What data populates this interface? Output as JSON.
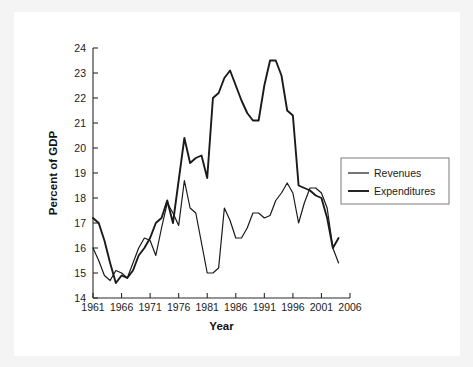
{
  "figure": {
    "background_color": "#f4f4f4",
    "card_color": "#ffffff",
    "line_color": "#1a1a1a"
  },
  "chart_data": {
    "type": "line",
    "title": "",
    "xlabel": "Year",
    "ylabel": "Percent of GDP",
    "xlim": [
      1961,
      2006
    ],
    "ylim": [
      14,
      24
    ],
    "xticks": [
      1961,
      1966,
      1971,
      1976,
      1981,
      1986,
      1991,
      1996,
      2001,
      2006
    ],
    "yticks": [
      14,
      15,
      16,
      17,
      18,
      19,
      20,
      21,
      22,
      23,
      24
    ],
    "xtick_labels": [
      "1961",
      "1966",
      "1971",
      "1976",
      "1981",
      "1986",
      "1991",
      "1996",
      "2001",
      "2006"
    ],
    "ytick_labels": [
      "14",
      "15",
      "16",
      "17",
      "18",
      "19",
      "20",
      "21",
      "22",
      "23",
      "24"
    ],
    "grid": false,
    "legend_position": "right",
    "x": [
      1961,
      1962,
      1963,
      1964,
      1965,
      1966,
      1967,
      1968,
      1969,
      1970,
      1971,
      1972,
      1973,
      1974,
      1975,
      1976,
      1977,
      1978,
      1979,
      1980,
      1981,
      1982,
      1983,
      1984,
      1985,
      1986,
      1987,
      1988,
      1989,
      1990,
      1991,
      1992,
      1993,
      1994,
      1995,
      1996,
      1997,
      1998,
      1999,
      2000,
      2001,
      2002,
      2003,
      2004
    ],
    "series": [
      {
        "name": "Revenues",
        "stroke_width": 1.2,
        "values": [
          16.0,
          15.5,
          14.9,
          14.7,
          15.1,
          15.0,
          14.8,
          15.4,
          16.0,
          16.4,
          16.3,
          15.7,
          16.8,
          17.8,
          17.4,
          16.9,
          18.7,
          17.6,
          17.4,
          16.2,
          15.0,
          15.0,
          15.2,
          17.6,
          17.1,
          16.4,
          16.4,
          16.8,
          17.4,
          17.4,
          17.2,
          17.3,
          17.9,
          18.2,
          18.6,
          18.2,
          17.0,
          17.8,
          18.4,
          18.4,
          18.2,
          17.6,
          16.0,
          15.4
        ]
      },
      {
        "name": "Expenditures",
        "stroke_width": 1.9,
        "values": [
          17.2,
          17.0,
          16.3,
          15.4,
          14.6,
          14.9,
          14.8,
          15.1,
          15.7,
          16.0,
          16.4,
          17.0,
          17.2,
          17.9,
          17.0,
          18.7,
          20.4,
          19.4,
          19.6,
          19.7,
          18.8,
          22.0,
          22.2,
          22.8,
          23.1,
          22.5,
          21.9,
          21.4,
          21.1,
          21.1,
          22.5,
          23.5,
          23.5,
          22.9,
          21.5,
          21.3,
          18.5,
          18.4,
          18.3,
          18.1,
          18.0,
          17.2,
          16.0,
          16.4
        ]
      }
    ]
  },
  "legend": {
    "items": [
      {
        "label": "Revenues"
      },
      {
        "label": "Expenditures"
      }
    ]
  },
  "axes": {
    "x_title": "Year",
    "y_title": "Percent of GDP"
  }
}
